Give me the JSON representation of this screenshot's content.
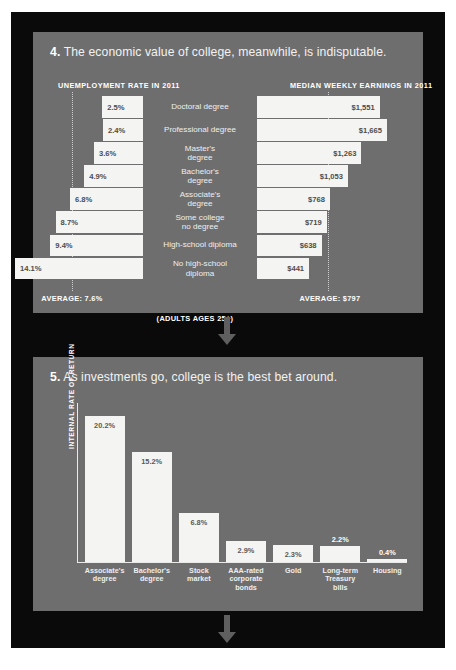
{
  "panel4": {
    "number": "4.",
    "title": "The economic value of college, meanwhile, is indisputable.",
    "left_heading": "UNEMPLOYMENT RATE IN 2011",
    "right_heading": "MEDIAN WEEKLY EARNINGS IN 2011",
    "left_average_label": "AVERAGE: 7.6%",
    "right_average_label": "AVERAGE: $797",
    "footnote": "(ADULTS AGES 25+)"
  },
  "panel5": {
    "number": "5.",
    "title": "As investments go, college is the best bet around.",
    "y_axis_title": "INTERNAL RATE OF RETURN"
  },
  "chart_data": [
    {
      "type": "bar",
      "orientation": "horizontal-diverging",
      "title": "The economic value of college, meanwhile, is indisputable.",
      "categories": [
        "Doctoral degree",
        "Professional degree",
        "Master's degree",
        "Bachelor's degree",
        "Associate's degree",
        "Some college no degree",
        "High-school diploma",
        "No high-school diploma"
      ],
      "series": [
        {
          "name": "UNEMPLOYMENT RATE IN 2011",
          "unit": "percent",
          "values": [
            2.5,
            2.4,
            3.6,
            4.9,
            6.8,
            8.7,
            9.4,
            14.1
          ],
          "labels": [
            "2.5%",
            "2.4%",
            "3.6%",
            "4.9%",
            "6.8%",
            "8.7%",
            "9.4%",
            "14.1%"
          ],
          "average": 7.6,
          "average_label": "AVERAGE: 7.6%",
          "direction": "left"
        },
        {
          "name": "MEDIAN WEEKLY EARNINGS IN 2011",
          "unit": "usd",
          "values": [
            1551,
            1665,
            1263,
            1053,
            768,
            719,
            638,
            441
          ],
          "labels": [
            "$1,551",
            "$1,665",
            "$1,263",
            "$1,053",
            "$768",
            "$719",
            "$638",
            "$441"
          ],
          "average": 797,
          "average_label": "AVERAGE: $797",
          "direction": "right"
        }
      ],
      "annotation": "(ADULTS AGES 25+)",
      "grid": false,
      "legend": "none"
    },
    {
      "type": "bar",
      "orientation": "vertical",
      "title": "As investments go, college is the best bet around.",
      "ylabel": "INTERNAL RATE OF RETURN",
      "xlabel": "",
      "ylim": [
        0,
        22
      ],
      "grid": false,
      "legend": "none",
      "categories": [
        "Associate's degree",
        "Bachelor's degree",
        "Stock market",
        "AAA-rated corporate bonds",
        "Gold",
        "Long-term Treasury bills",
        "Housing"
      ],
      "category_lines": [
        [
          "Associate's",
          "degree"
        ],
        [
          "Bachelor's",
          "degree"
        ],
        [
          "Stock",
          "market"
        ],
        [
          "AAA-rated",
          "corporate",
          "bonds"
        ],
        [
          "Gold"
        ],
        [
          "Long-term",
          "Treasury",
          "bills"
        ],
        [
          "Housing"
        ]
      ],
      "values": [
        20.2,
        15.2,
        6.8,
        2.9,
        2.3,
        2.2,
        0.4
      ],
      "labels": [
        "20.2%",
        "15.2%",
        "6.8%",
        "2.9%",
        "2.3%",
        "2.2%",
        "0.4%"
      ]
    }
  ],
  "colors": {
    "page_background": "#ffffff",
    "field": "#0a0a0a",
    "panel": "#6e6e6e",
    "bar": "#f4f4f2",
    "bar_text": "#4d4d4d",
    "panel_text": "#f2f2f2",
    "arrow": "#5f5f5f"
  }
}
